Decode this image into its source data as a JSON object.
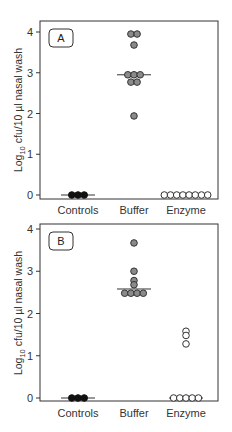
{
  "chart_data": [
    {
      "type": "scatter",
      "panel": "A",
      "ylabel": "Log10 cfu/10 µl nasal wash",
      "ylabel_parts": {
        "pre": "Log",
        "sub": "10",
        "post": " cfu/10 µl nasal wash"
      },
      "ylim": [
        0,
        4
      ],
      "yticks": [
        "0",
        "1",
        "2",
        "3",
        "4"
      ],
      "categories": [
        "Controls",
        "Buffer",
        "Enzyme"
      ],
      "grid": false,
      "series": [
        {
          "name": "Controls",
          "marker": "filled-black",
          "values": [
            0,
            0,
            0
          ],
          "median": 0
        },
        {
          "name": "Buffer",
          "marker": "filled-gray",
          "values": [
            3.95,
            3.95,
            3.68,
            2.95,
            2.95,
            2.95,
            2.77,
            2.77,
            1.94
          ],
          "median": 2.95
        },
        {
          "name": "Enzyme",
          "marker": "open",
          "values": [
            0,
            0,
            0,
            0,
            0,
            0,
            0,
            0
          ],
          "median": 0
        }
      ]
    },
    {
      "type": "scatter",
      "panel": "B",
      "ylabel": "Log10 cfu/10 µl nasal wash",
      "ylabel_parts": {
        "pre": "Log",
        "sub": "10",
        "post": " cfu/10 µl nasal wash"
      },
      "ylim": [
        0,
        4
      ],
      "yticks": [
        "0",
        "1",
        "2",
        "3",
        "4"
      ],
      "categories": [
        "Controls",
        "Buffer",
        "Enzyme"
      ],
      "grid": false,
      "series": [
        {
          "name": "Controls",
          "marker": "filled-black",
          "values": [
            0,
            0,
            0
          ],
          "median": 0
        },
        {
          "name": "Buffer",
          "marker": "filled-gray",
          "values": [
            3.67,
            3.0,
            2.78,
            2.68,
            2.48,
            2.48,
            2.48,
            2.48
          ],
          "median": 2.58
        },
        {
          "name": "Enzyme",
          "marker": "open",
          "values": [
            1.58,
            1.48,
            1.28,
            0,
            0,
            0,
            0,
            0
          ],
          "median": 0
        }
      ]
    }
  ],
  "colors": {
    "axis": "#333333",
    "filled_black": "#111111",
    "filled_gray": "#8a8a8a",
    "open_fill": "#ffffff",
    "marker_stroke": "#333333"
  }
}
